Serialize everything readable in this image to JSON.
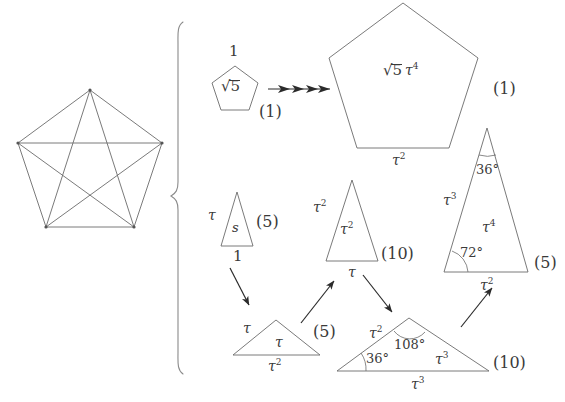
{
  "figure": {
    "background": "#ffffff",
    "stroke": "#5a5a5a",
    "text_color": "#3a3a3a",
    "width": 565,
    "height": 402
  },
  "pentagram": {
    "name": "pentagram-in-pentagon",
    "description": "regular pentagon with all five diagonals drawn forming a pentagram"
  },
  "brace": {
    "symbol": "{",
    "name": "large-left-brace"
  },
  "small_pentagon": {
    "top_label": "1",
    "inner_label": "√5",
    "inner_radicand": "5",
    "mult_label": "(1)"
  },
  "arrow_multi": {
    "name": "multi-arrow",
    "heads": 4
  },
  "big_pentagon": {
    "inner_label": "√5 τ⁴",
    "inner_radicand": "5",
    "inner_tau": "τ",
    "inner_tau_exp": "4",
    "base_label": "τ²",
    "base_tau": "τ",
    "base_exp": "2",
    "mult_label": "(1)"
  },
  "triangles": [
    {
      "id": "tri-s",
      "name": "triangle-s",
      "left_side": "τ",
      "left_side_tau": "τ",
      "left_side_exp": "",
      "inner": "s",
      "base": "1",
      "mult_label": "(5)",
      "angles": []
    },
    {
      "id": "tri-tau2",
      "name": "triangle-tau2",
      "left_side_tau": "τ",
      "left_side_exp": "2",
      "inner_tau": "τ",
      "inner_exp": "2",
      "base_tau": "τ",
      "base_exp": "",
      "mult_label": "(10)",
      "angles": []
    },
    {
      "id": "tri-tau4",
      "name": "triangle-tau4",
      "left_side_tau": "τ",
      "left_side_exp": "3",
      "inner_tau": "τ",
      "inner_exp": "4",
      "base_tau": "τ",
      "base_exp": "2",
      "mult_label": "(5)",
      "apex_angle": "36°",
      "base_angle": "72°"
    },
    {
      "id": "tri-flat",
      "name": "triangle-flat-tau",
      "left_side_tau": "τ",
      "left_side_exp": "",
      "inner_tau": "τ",
      "inner_exp": "",
      "base_tau": "τ",
      "base_exp": "2",
      "mult_label": "(5)",
      "angles": []
    },
    {
      "id": "tri-obtuse",
      "name": "triangle-obtuse-108",
      "left_side_tau": "τ",
      "left_side_exp": "2",
      "inner_tau": "τ",
      "inner_exp": "3",
      "base_tau": "τ",
      "base_exp": "3",
      "mult_label": "(10)",
      "apex_angle": "108°",
      "base_angle": "36°"
    }
  ],
  "arrows": [
    {
      "name": "arrow-s-to-flat",
      "from": "tri-s",
      "to": "tri-flat"
    },
    {
      "name": "arrow-flat-to-tau2",
      "from": "tri-flat",
      "to": "tri-tau2"
    },
    {
      "name": "arrow-tau2-to-obtuse",
      "from": "tri-tau2",
      "to": "tri-obtuse"
    },
    {
      "name": "arrow-obtuse-to-tau4",
      "from": "tri-obtuse",
      "to": "tri-tau4"
    }
  ]
}
